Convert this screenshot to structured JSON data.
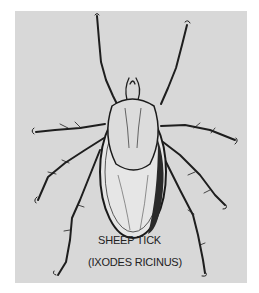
{
  "illustration": {
    "subject": "tick illustration",
    "caption_line1": "SHEEP TICK",
    "caption_line2": "(IXODES RICINUS)",
    "colors": {
      "panel": "#d8d8d8",
      "page": "#ffffff",
      "ink": "#1a1a1a"
    }
  }
}
